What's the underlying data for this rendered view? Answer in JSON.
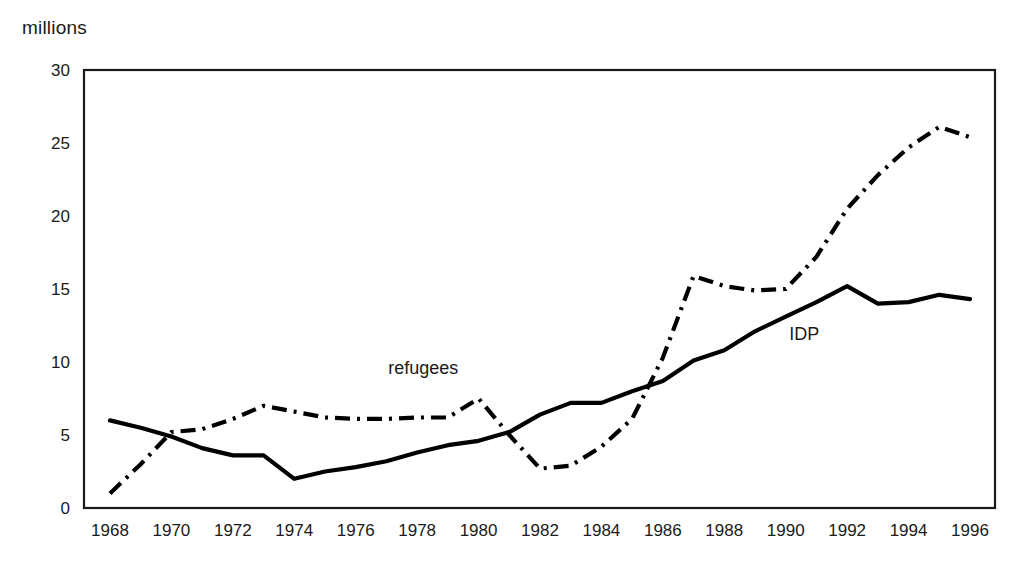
{
  "chart_data": {
    "type": "line",
    "title": "",
    "ylabel": "millions",
    "xlabel": "",
    "ylim": [
      0,
      30
    ],
    "xlim": [
      1968,
      1996
    ],
    "yticks": [
      0,
      5,
      10,
      15,
      20,
      25,
      30
    ],
    "xticks": [
      1968,
      1970,
      1972,
      1974,
      1976,
      1978,
      1980,
      1982,
      1984,
      1986,
      1988,
      1990,
      1992,
      1994,
      1996
    ],
    "grid": false,
    "legend_position": "inline-annotation",
    "x": [
      1968,
      1969,
      1970,
      1971,
      1972,
      1973,
      1974,
      1975,
      1976,
      1977,
      1978,
      1979,
      1980,
      1981,
      1982,
      1983,
      1984,
      1985,
      1986,
      1987,
      1988,
      1989,
      1990,
      1991,
      1992,
      1993,
      1994,
      1995,
      1996
    ],
    "series": [
      {
        "name": "IDP",
        "style": "solid",
        "color": "#000000",
        "values": [
          6.0,
          5.5,
          4.9,
          4.1,
          3.6,
          3.6,
          2.0,
          2.5,
          2.8,
          3.2,
          3.8,
          4.3,
          4.6,
          5.2,
          6.4,
          7.2,
          7.2,
          8.0,
          8.7,
          10.1,
          10.8,
          12.1,
          13.1,
          14.1,
          15.2,
          14.0,
          14.1,
          14.6,
          14.3
        ],
        "label_year": 1990,
        "label_value": 12.5
      },
      {
        "name": "refugees",
        "style": "dash-dot",
        "color": "#000000",
        "values": [
          1.0,
          3.0,
          5.2,
          5.4,
          6.1,
          7.0,
          6.6,
          6.2,
          6.1,
          6.1,
          6.2,
          6.2,
          7.5,
          5.0,
          2.7,
          2.9,
          4.2,
          6.1,
          10.3,
          15.9,
          15.2,
          14.9,
          15.0,
          17.2,
          20.5,
          22.8,
          24.7,
          26.1,
          25.4
        ]
      }
    ],
    "annotations": [
      {
        "text": "refugees",
        "x": 1978.2,
        "y": 9.2
      },
      {
        "text": "IDP",
        "x": 1990.6,
        "y": 11.5
      }
    ]
  },
  "axis": {
    "unit_label": "millions"
  },
  "caption": {
    "text": ""
  }
}
